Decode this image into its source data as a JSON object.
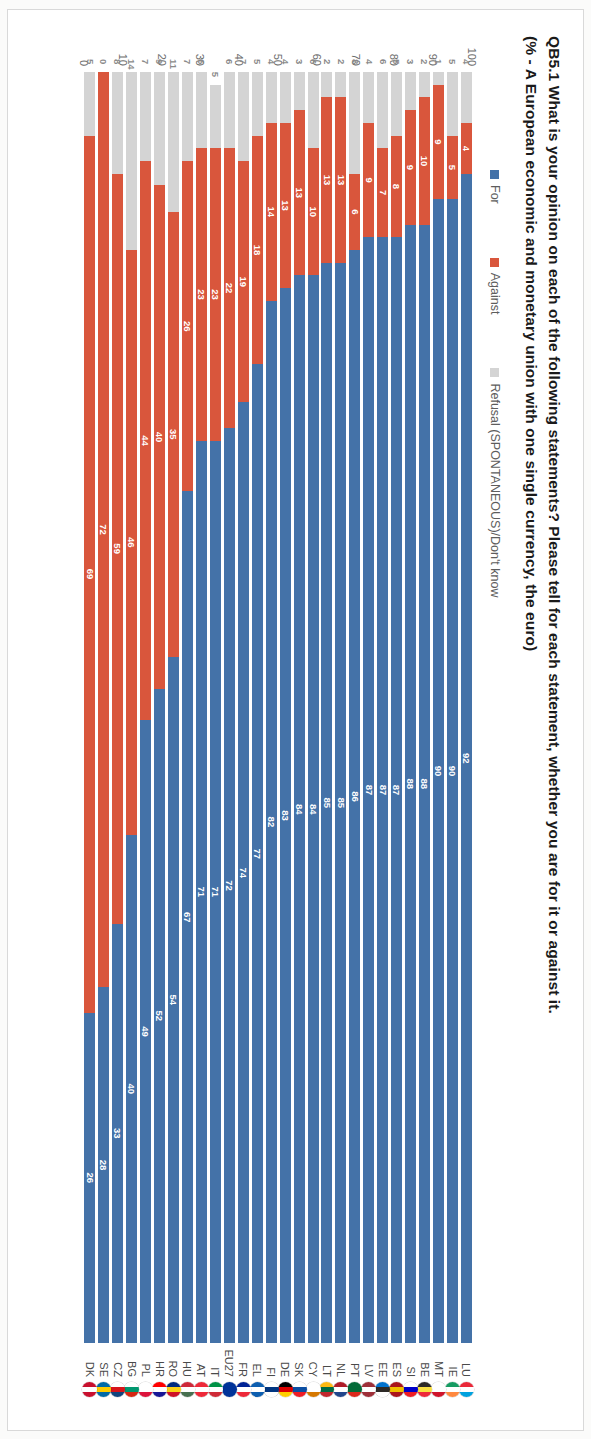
{
  "title": {
    "line1": "QB5.1 What is your opinion on each of the following statements? Please tell for each statement, whether you are for it or against it.",
    "line2": "(% - A European economic and monetary union with one single currency, the euro)"
  },
  "legend": {
    "items": [
      {
        "label": "For",
        "color": "#4472a8"
      },
      {
        "label": "Against",
        "color": "#d9563c"
      },
      {
        "label": "Refusal (SPONTANEOUS)/Don't know",
        "color": "#d4d4d4"
      }
    ]
  },
  "axis": {
    "ticks": [
      "100",
      "90",
      "80",
      "70",
      "60",
      "50",
      "40",
      "30",
      "20",
      "10",
      "0"
    ],
    "max": 100,
    "min": 0
  },
  "chart_data": {
    "type": "bar",
    "orientation": "horizontal-stacked",
    "title": "QB5.1 What is your opinion on each of the following statements? Please tell for each statement, whether you are for it or against it.",
    "subtitle": "(% - A European economic and monetary union with one single currency, the euro)",
    "xlabel": "",
    "ylabel": "",
    "xlim": [
      0,
      100
    ],
    "grid": false,
    "legend_position": "top",
    "categories": [
      "LU",
      "IE",
      "MT",
      "BE",
      "SI",
      "ES",
      "EE",
      "LV",
      "PT",
      "NL",
      "LT",
      "CY",
      "SK",
      "DE",
      "FI",
      "EL",
      "FR",
      "EU27",
      "IT",
      "AT",
      "HU",
      "RO",
      "HR",
      "PL",
      "BG",
      "CZ",
      "SE",
      "DK"
    ],
    "series": [
      {
        "name": "For",
        "color": "#4472a8",
        "values": [
          92,
          90,
          90,
          88,
          88,
          87,
          87,
          87,
          86,
          85,
          85,
          84,
          84,
          83,
          82,
          77,
          74,
          72,
          71,
          71,
          67,
          54,
          52,
          49,
          40,
          33,
          28,
          26
        ]
      },
      {
        "name": "Against",
        "color": "#d9563c",
        "values": [
          4,
          5,
          9,
          10,
          9,
          8,
          7,
          9,
          6,
          13,
          13,
          10,
          13,
          13,
          14,
          18,
          19,
          22,
          23,
          23,
          26,
          35,
          40,
          44,
          46,
          59,
          72,
          69
        ]
      },
      {
        "name": "Refusal (SPONTANEOUS)/Don't know",
        "color": "#d4d4d4",
        "values": [
          4,
          5,
          1,
          2,
          3,
          5,
          6,
          4,
          8,
          2,
          2,
          6,
          3,
          4,
          4,
          5,
          7,
          6,
          5,
          6,
          7,
          11,
          9,
          7,
          14,
          8,
          0,
          5
        ]
      }
    ]
  },
  "countries": [
    {
      "code": "LU",
      "for": 92,
      "against": 4,
      "refusal": 4,
      "flag": [
        "#ea2839",
        "#ffffff",
        "#00a1de"
      ]
    },
    {
      "code": "IE",
      "for": 90,
      "against": 5,
      "refusal": 5,
      "flag": [
        "#169b62",
        "#ffffff",
        "#ff883e"
      ]
    },
    {
      "code": "MT",
      "for": 90,
      "against": 9,
      "refusal": 1,
      "flag": [
        "#ffffff",
        "#ffffff",
        "#cf142b"
      ]
    },
    {
      "code": "BE",
      "for": 88,
      "against": 10,
      "refusal": 2,
      "flag": [
        "#2d2926",
        "#fae042",
        "#ed2939"
      ]
    },
    {
      "code": "SI",
      "for": 88,
      "against": 9,
      "refusal": 3,
      "flag": [
        "#ffffff",
        "#0000c8",
        "#ed1c24"
      ]
    },
    {
      "code": "ES",
      "for": 87,
      "against": 8,
      "refusal": 5,
      "flag": [
        "#aa151b",
        "#f1bf00",
        "#aa151b"
      ]
    },
    {
      "code": "EE",
      "for": 87,
      "against": 7,
      "refusal": 6,
      "flag": [
        "#0072ce",
        "#2d2926",
        "#ffffff"
      ]
    },
    {
      "code": "LV",
      "for": 87,
      "against": 9,
      "refusal": 4,
      "flag": [
        "#9e3039",
        "#ffffff",
        "#9e3039"
      ]
    },
    {
      "code": "PT",
      "for": 86,
      "against": 6,
      "refusal": 8,
      "flag": [
        "#046a38",
        "#046a38",
        "#da291c"
      ]
    },
    {
      "code": "NL",
      "for": 85,
      "against": 13,
      "refusal": 2,
      "flag": [
        "#ae1c28",
        "#ffffff",
        "#21468b"
      ]
    },
    {
      "code": "LT",
      "for": 85,
      "against": 13,
      "refusal": 2,
      "flag": [
        "#fdb913",
        "#006a44",
        "#c1272d"
      ]
    },
    {
      "code": "CY",
      "for": 84,
      "against": 10,
      "refusal": 6,
      "flag": [
        "#ffffff",
        "#ffffff",
        "#d57800"
      ]
    },
    {
      "code": "SK",
      "for": 84,
      "against": 13,
      "refusal": 3,
      "flag": [
        "#ffffff",
        "#0b4ea2",
        "#ee1c25"
      ]
    },
    {
      "code": "DE",
      "for": 83,
      "against": 13,
      "refusal": 4,
      "flag": [
        "#000000",
        "#dd0000",
        "#ffce00"
      ]
    },
    {
      "code": "FI",
      "for": 82,
      "against": 14,
      "refusal": 4,
      "flag": [
        "#ffffff",
        "#003580",
        "#ffffff"
      ]
    },
    {
      "code": "EL",
      "for": 77,
      "against": 18,
      "refusal": 5,
      "flag": [
        "#0d5eaf",
        "#ffffff",
        "#0d5eaf"
      ]
    },
    {
      "code": "FR",
      "for": 74,
      "against": 19,
      "refusal": 7,
      "flag": [
        "#002395",
        "#ffffff",
        "#ed2939"
      ]
    },
    {
      "code": "EU27",
      "for": 72,
      "against": 22,
      "refusal": 6,
      "flag": [
        "#003399",
        "#003399",
        "#003399"
      ]
    },
    {
      "code": "IT",
      "for": 71,
      "against": 23,
      "refusal": 5,
      "flag": [
        "#009246",
        "#ffffff",
        "#ce2b37"
      ]
    },
    {
      "code": "AT",
      "for": 71,
      "against": 23,
      "refusal": 6,
      "flag": [
        "#ed2939",
        "#ffffff",
        "#ed2939"
      ]
    },
    {
      "code": "HU",
      "for": 67,
      "against": 26,
      "refusal": 7,
      "flag": [
        "#ce2939",
        "#ffffff",
        "#477050"
      ]
    },
    {
      "code": "RO",
      "for": 54,
      "against": 35,
      "refusal": 11,
      "flag": [
        "#002b7f",
        "#fcd116",
        "#ce1126"
      ]
    },
    {
      "code": "HR",
      "for": 52,
      "against": 40,
      "refusal": 9,
      "flag": [
        "#ff0000",
        "#ffffff",
        "#171796"
      ]
    },
    {
      "code": "PL",
      "for": 49,
      "against": 44,
      "refusal": 7,
      "flag": [
        "#ffffff",
        "#ffffff",
        "#dc143c"
      ]
    },
    {
      "code": "BG",
      "for": 40,
      "against": 46,
      "refusal": 14,
      "flag": [
        "#ffffff",
        "#00966e",
        "#d62612"
      ]
    },
    {
      "code": "CZ",
      "for": 33,
      "against": 59,
      "refusal": 8,
      "flag": [
        "#ffffff",
        "#d7141a",
        "#11457e"
      ]
    },
    {
      "code": "SE",
      "for": 28,
      "against": 72,
      "refusal": 0,
      "flag": [
        "#006aa7",
        "#fecc00",
        "#006aa7"
      ]
    },
    {
      "code": "DK",
      "for": 26,
      "against": 69,
      "refusal": 5,
      "flag": [
        "#c8102e",
        "#ffffff",
        "#c8102e"
      ]
    }
  ]
}
